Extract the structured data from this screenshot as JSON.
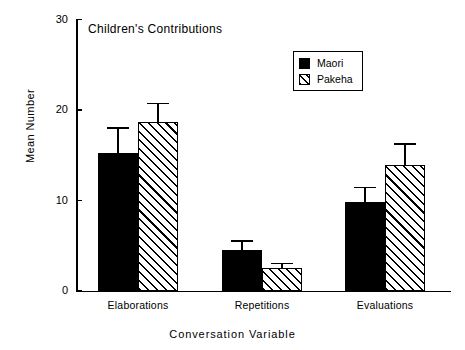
{
  "chart_data": {
    "type": "bar",
    "title": "Children's  Contributions",
    "xlabel": "Conversation  Variable",
    "ylabel": "Mean Number",
    "categories": [
      "Elaborations",
      "Repetitions",
      "Evaluations"
    ],
    "ylim": [
      0,
      30
    ],
    "yticks": [
      0,
      10,
      20,
      30
    ],
    "ytick_labels": [
      "0",
      "10",
      "20",
      "30"
    ],
    "grid": false,
    "legend_position": "top-right",
    "series": [
      {
        "name": "Maori",
        "fill": "solid-black",
        "color": "#000000",
        "values": [
          15.2,
          4.5,
          9.8
        ],
        "errors": [
          2.9,
          1.1,
          1.7
        ]
      },
      {
        "name": "Pakeha",
        "fill": "diagonal-hatch",
        "color": "#000000",
        "values": [
          18.7,
          2.5,
          13.9
        ],
        "errors": [
          2.1,
          0.6,
          2.4
        ]
      }
    ]
  }
}
